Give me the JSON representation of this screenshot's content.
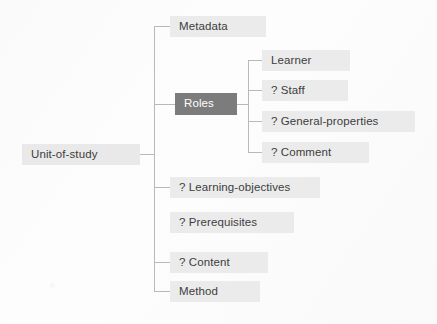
{
  "diagram": {
    "type": "tree",
    "colors": {
      "node_background": "#ebebeb",
      "node_text": "#3d3d3d",
      "highlight_background": "#7c7c7c",
      "highlight_text": "#ffffff",
      "edge_line": "#b9b9b9",
      "page_background": "#fdfdfd"
    },
    "root": {
      "label": "Unit-of-study",
      "x": 22,
      "y": 144,
      "width": 118,
      "height": 21,
      "highlighted": false,
      "has_connector": true
    },
    "trunk": {
      "x": 154,
      "top": 26,
      "bottom": 291
    },
    "children": [
      {
        "label": "Metadata",
        "x": 170,
        "y": 16,
        "width": 96,
        "height": 21,
        "center_y": 26,
        "highlighted": false,
        "has_connector": true,
        "optional_marker": ""
      },
      {
        "label": "Roles",
        "x": 175,
        "y": 93,
        "width": 62,
        "height": 22,
        "center_y": 104,
        "highlighted": true,
        "has_connector": true,
        "optional_marker": ""
      },
      {
        "label": "? Learning-objectives",
        "x": 170,
        "y": 177,
        "width": 150,
        "height": 21,
        "center_y": 187,
        "highlighted": false,
        "has_connector": true,
        "optional_marker": "?"
      },
      {
        "label": "? Prerequisites",
        "x": 170,
        "y": 212,
        "width": 124,
        "height": 21,
        "center_y": 222,
        "highlighted": false,
        "has_connector": false,
        "optional_marker": "?"
      },
      {
        "label": "? Content",
        "x": 170,
        "y": 252,
        "width": 98,
        "height": 21,
        "center_y": 262,
        "highlighted": false,
        "has_connector": true,
        "optional_marker": "?"
      },
      {
        "label": "Method",
        "x": 170,
        "y": 281,
        "width": 90,
        "height": 21,
        "center_y": 291,
        "highlighted": false,
        "has_connector": true,
        "optional_marker": ""
      }
    ],
    "subtrunk": {
      "parent": "Roles",
      "x": 248,
      "top": 60,
      "bottom": 152,
      "stem_from_x": 237,
      "stem_y": 104
    },
    "grandchildren": [
      {
        "label": "Learner",
        "x": 262,
        "y": 50,
        "width": 88,
        "height": 21,
        "center_y": 60,
        "highlighted": false,
        "has_connector": true,
        "optional_marker": ""
      },
      {
        "label": "? Staff",
        "x": 262,
        "y": 80,
        "width": 86,
        "height": 21,
        "center_y": 90,
        "highlighted": false,
        "has_connector": true,
        "optional_marker": "?"
      },
      {
        "label": "? General-properties",
        "x": 262,
        "y": 111,
        "width": 153,
        "height": 21,
        "center_y": 121,
        "highlighted": false,
        "has_connector": true,
        "optional_marker": "?"
      },
      {
        "label": "? Comment",
        "x": 262,
        "y": 142,
        "width": 107,
        "height": 21,
        "center_y": 152,
        "highlighted": false,
        "has_connector": true,
        "optional_marker": "?"
      }
    ]
  }
}
